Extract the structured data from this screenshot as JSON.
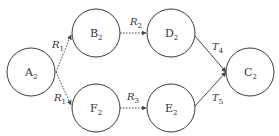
{
  "nodes": [
    {
      "id": "A",
      "letter": "A",
      "sub": "2",
      "cx": 31,
      "cy": 72
    },
    {
      "id": "B",
      "letter": "B",
      "sub": "2",
      "cx": 96,
      "cy": 33
    },
    {
      "id": "F",
      "letter": "F",
      "sub": "2",
      "cx": 96,
      "cy": 108
    },
    {
      "id": "D",
      "letter": "D",
      "sub": "2",
      "cx": 171,
      "cy": 33
    },
    {
      "id": "E",
      "letter": "E",
      "sub": "2",
      "cx": 171,
      "cy": 108
    },
    {
      "id": "C",
      "letter": "C",
      "sub": "2",
      "cx": 250,
      "cy": 72
    }
  ],
  "edges": [
    {
      "from": "A",
      "to": "B",
      "letter": "R",
      "sub": "1",
      "style": "dashed"
    },
    {
      "from": "A",
      "to": "F",
      "letter": "R",
      "sub": "1",
      "style": "dashed"
    },
    {
      "from": "B",
      "to": "D",
      "letter": "R",
      "sub": "2",
      "style": "dashed"
    },
    {
      "from": "F",
      "to": "E",
      "letter": "R",
      "sub": "3",
      "style": "dashed"
    },
    {
      "from": "D",
      "to": "C",
      "letter": "T",
      "sub": "4",
      "style": "solid"
    },
    {
      "from": "E",
      "to": "C",
      "letter": "T",
      "sub": "5",
      "style": "solid"
    }
  ]
}
